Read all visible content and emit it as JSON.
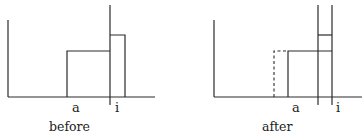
{
  "panels": [
    {
      "caption": "before",
      "labels": {
        "a": "a",
        "i": "i"
      }
    },
    {
      "caption": "after",
      "labels": {
        "a": "a",
        "i": "i"
      }
    }
  ],
  "colors": {
    "ink": "#2a2a2a"
  }
}
